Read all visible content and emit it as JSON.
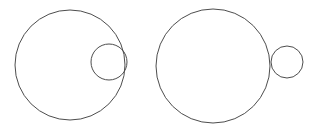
{
  "figure": {
    "background_color": "#ffffff",
    "stroke_color": "#4d4d4d",
    "stroke_width": 1,
    "canvas": {
      "width": 314,
      "height": 131
    },
    "panels": [
      {
        "name": "internal-tangency",
        "label": "Internally tangent circles",
        "circles": [
          {
            "name": "large-circle",
            "role": "outer",
            "cx": 70,
            "cy": 65,
            "r": 55
          },
          {
            "name": "small-circle",
            "role": "inner",
            "cx": 109,
            "cy": 62,
            "r": 18
          }
        ],
        "tangent_point": {
          "x": 127,
          "y": 62
        }
      },
      {
        "name": "external-tangency",
        "label": "Externally tangent circles",
        "circles": [
          {
            "name": "large-circle",
            "role": "outer",
            "cx": 213,
            "cy": 66,
            "r": 57
          },
          {
            "name": "small-circle",
            "role": "outer-tangent",
            "cx": 287,
            "cy": 62,
            "r": 16
          }
        ],
        "tangent_point": {
          "x": 271,
          "y": 62
        }
      }
    ]
  }
}
